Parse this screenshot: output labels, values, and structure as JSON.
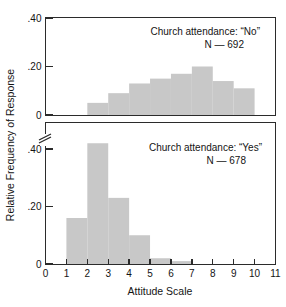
{
  "chart_data": {
    "type": "bar",
    "title": "",
    "xlabel": "Attitude Scale",
    "ylabel": "Relative Frequency of Response",
    "xlim": [
      0,
      11
    ],
    "ylim": [
      0,
      0.4
    ],
    "grid": false,
    "legend": "none",
    "x_ticks": [
      "0",
      "1",
      "2",
      "3",
      "4",
      "5",
      "6",
      "7",
      "8",
      "9",
      "10",
      "11"
    ],
    "x_tick_values": [
      0,
      1,
      2,
      3,
      4,
      5,
      6,
      7,
      8,
      9,
      10,
      11
    ],
    "panels": [
      {
        "id": "no",
        "position": "top",
        "annotation_line1": "Church attendance: “No”",
        "annotation_line2": "N — 692",
        "n": 692,
        "y_ticks": [
          "0",
          ".20",
          ".40"
        ],
        "y_tick_values": [
          0,
          0.2,
          0.4
        ],
        "axis_break": false,
        "bin_edges": [
          2,
          3,
          4,
          5,
          6,
          7,
          8,
          9,
          10
        ],
        "bin_labels": [
          "2-3",
          "3-4",
          "4-5",
          "5-6",
          "6-7",
          "7-8",
          "8-9",
          "9-10"
        ],
        "values": [
          0.05,
          0.09,
          0.13,
          0.15,
          0.17,
          0.2,
          0.14,
          0.11
        ]
      },
      {
        "id": "yes",
        "position": "bottom",
        "annotation_line1": "Church attendance: “Yes”",
        "annotation_line2": "N — 678",
        "n": 678,
        "y_ticks": [
          "0",
          ".20",
          ".40"
        ],
        "y_tick_values": [
          0,
          0.2,
          0.4
        ],
        "axis_break": true,
        "bin_edges": [
          1,
          2,
          3,
          4,
          5,
          6,
          7
        ],
        "bin_labels": [
          "1-2",
          "2-3",
          "3-4",
          "4-5",
          "5-6",
          "6-7"
        ],
        "values": [
          0.16,
          0.42,
          0.23,
          0.1,
          0.02,
          0.01
        ]
      }
    ],
    "colors": {
      "bar_fill": "#c8c8c8",
      "axis": "#2b2b2b",
      "background": "#ffffff",
      "text": "#141414"
    }
  }
}
